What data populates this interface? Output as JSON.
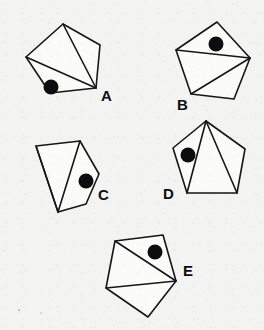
{
  "figure": {
    "background_color": "#f3f3f1",
    "ink_color": "#16161a",
    "dot_color": "#0d0d10",
    "canvas": {
      "width": 264,
      "height": 330
    },
    "shape_count": 5
  },
  "shapes": [
    {
      "id": "A",
      "label": "A",
      "label_pos": {
        "x": 101,
        "y": 97
      },
      "outline": "63,24 100,45 96,88 50,93 26,57",
      "chords": [
        "63,24 96,88",
        "26,57 96,88"
      ],
      "dot": {
        "cx": 51,
        "cy": 87,
        "r": 7.5
      }
    },
    {
      "id": "B",
      "label": "B",
      "label_pos": {
        "x": 177,
        "y": 106
      },
      "outline": "217,22 250,58 234,99 191,94 176,50",
      "chords": [
        "176,50 250,58",
        "191,94 250,58"
      ],
      "dot": {
        "cx": 216,
        "cy": 44,
        "r": 7.5
      }
    },
    {
      "id": "C",
      "label": "C",
      "label_pos": {
        "x": 98,
        "y": 196
      },
      "outline": "36,146 80,141 99,174 86,204 58,212",
      "chords": [
        "36,146 58,212",
        "80,141 58,212"
      ],
      "dot": {
        "cx": 86,
        "cy": 181,
        "r": 7.5
      }
    },
    {
      "id": "D",
      "label": "D",
      "label_pos": {
        "x": 163,
        "y": 195
      },
      "outline": "206,121 245,149 237,193 187,193 173,148",
      "chords": [
        "206,121 187,193",
        "206,121 237,193"
      ],
      "dot": {
        "cx": 188,
        "cy": 155,
        "r": 7.5
      }
    },
    {
      "id": "E",
      "label": "E",
      "label_pos": {
        "x": 183,
        "y": 272
      },
      "outline": "115,241 163,235 176,281 148,317 106,288",
      "chords": [
        "115,241 176,281",
        "106,288 176,281"
      ],
      "dot": {
        "cx": 155,
        "cy": 252,
        "r": 7.5
      }
    }
  ],
  "specks": [
    {
      "cx": 19,
      "cy": 310,
      "r": 1.1
    },
    {
      "cx": 41,
      "cy": 313,
      "r": 0.8
    }
  ]
}
